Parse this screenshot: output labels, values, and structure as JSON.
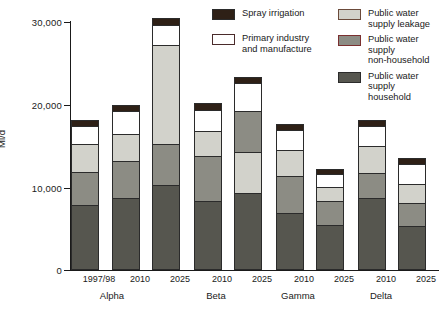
{
  "chart_data": {
    "type": "bar",
    "subtype": "stacked",
    "title": "",
    "xlabel": "",
    "ylabel": "Ml/d",
    "ylim": [
      0,
      30000
    ],
    "yticks": [
      0,
      10000,
      20000,
      30000
    ],
    "ytick_labels": [
      "0",
      "10,000",
      "20,000",
      "30,000"
    ],
    "grid": false,
    "legend_position": "top-right",
    "categories": [
      "1997/98",
      "2010",
      "2025",
      "2010",
      "2025",
      "2010",
      "2025",
      "2010",
      "2025"
    ],
    "groups": [
      {
        "name": "Alpha",
        "categories": [
          "1997/98",
          "2010",
          "2025"
        ]
      },
      {
        "name": "Beta",
        "categories": [
          "2010",
          "2025"
        ]
      },
      {
        "name": "Gamma",
        "categories": [
          "2010",
          "2025"
        ]
      },
      {
        "name": "Delta",
        "categories": [
          "2010",
          "2025"
        ]
      }
    ],
    "series": [
      {
        "name": "Public water supply household",
        "color": "#56564f",
        "values": [
          7600,
          8450,
          10000,
          8100,
          9050,
          6650,
          5200,
          8450,
          5100
        ]
      },
      {
        "name": "Public water supply non-household",
        "color": "#8c8c84",
        "values": [
          3980,
          4500,
          5000,
          5450,
          4950,
          4480,
          2900,
          3030,
          2780
        ]
      },
      {
        "name": "Public water supply leakage",
        "color": "#d2d2cb",
        "values": [
          3380,
          3270,
          11950,
          3020,
          4960,
          3140,
          1700,
          3270,
          2300
        ]
      },
      {
        "name": "Primary industry and manufacture",
        "color": "#ffffff",
        "values": [
          2180,
          2780,
          2420,
          2540,
          3390,
          2420,
          1570,
          2420,
          2420
        ]
      },
      {
        "name": "Spray irrigation",
        "color": "#2e2016",
        "values": [
          730,
          730,
          850,
          850,
          730,
          730,
          600,
          730,
          730
        ]
      }
    ],
    "stack_order_default": [
      "Public water supply household",
      "Public water supply non-household",
      "Public water supply leakage",
      "Primary industry and manufacture",
      "Spray irrigation"
    ],
    "bar_totals": [
      17870,
      19730,
      30220,
      19960,
      23080,
      17420,
      11970,
      17900,
      13330
    ]
  },
  "legend": {
    "items": [
      {
        "label": "Spray irrigation",
        "color": "#2e2016",
        "border": "#2b2b2b",
        "column": "a"
      },
      {
        "label": "Primary industry\nand manufacture",
        "color": "#ffffff",
        "border": "#4a2b2b",
        "column": "a"
      },
      {
        "label": "Public water\nsupply leakage",
        "color": "#d2d2cb",
        "border": "#6b4a3a",
        "column": "b"
      },
      {
        "label": "Public water supply\nnon-household",
        "color": "#8c8c84",
        "border": "#7a2f2f",
        "column": "b"
      },
      {
        "label": "Public water supply\nhousehold",
        "color": "#56564f",
        "border": "#2b2b2b",
        "column": "b"
      }
    ]
  },
  "axes": {
    "y_title": "Ml/d",
    "y_tick_labels": [
      "30,000",
      "20,000",
      "10,000",
      "0"
    ],
    "x_tick_labels": [
      "1997/98",
      "2010",
      "2025",
      "2010",
      "2025",
      "2010",
      "2025",
      "2010",
      "2025"
    ],
    "group_labels": [
      "Alpha",
      "Beta",
      "Gamma",
      "Delta"
    ]
  }
}
